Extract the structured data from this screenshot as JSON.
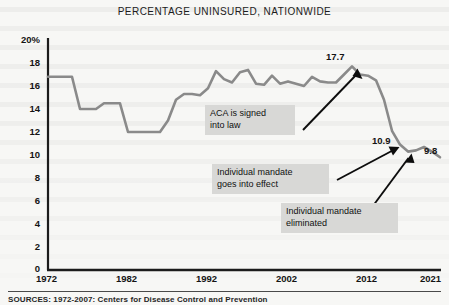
{
  "chart_data": {
    "type": "line",
    "title": "PERCENTAGE UNINSURED, NATIONWIDE",
    "xlabel": "",
    "ylabel": "",
    "xlim": [
      1972,
      2021
    ],
    "ylim": [
      0,
      20
    ],
    "grid": false,
    "legend": null,
    "line_color": "#8a8a8a",
    "xticks": [
      "1972",
      "1982",
      "1992",
      "2002",
      "2012",
      "2021"
    ],
    "xtick_values": [
      1972,
      1982,
      1992,
      2002,
      2012,
      2021
    ],
    "yticks": [
      "0",
      "2",
      "4",
      "6",
      "8",
      "10",
      "12",
      "14",
      "16",
      "18",
      "20%"
    ],
    "ytick_values": [
      0,
      2,
      4,
      6,
      8,
      10,
      12,
      14,
      16,
      18,
      20
    ],
    "series": [
      {
        "name": "Percentage uninsured, nationwide",
        "x": [
          1972,
          1973,
          1974,
          1975,
          1976,
          1977,
          1978,
          1979,
          1980,
          1981,
          1982,
          1983,
          1984,
          1985,
          1986,
          1987,
          1988,
          1989,
          1990,
          1991,
          1992,
          1993,
          1994,
          1995,
          1996,
          1997,
          1998,
          1999,
          2000,
          2001,
          2002,
          2003,
          2004,
          2005,
          2006,
          2007,
          2008,
          2009,
          2010,
          2011,
          2012,
          2013,
          2014,
          2015,
          2016,
          2017,
          2018,
          2019,
          2020,
          2021
        ],
        "y": [
          16.8,
          16.8,
          16.8,
          16.8,
          14.0,
          14.0,
          14.0,
          14.5,
          14.5,
          14.5,
          12.0,
          12.0,
          12.0,
          12.0,
          12.0,
          13.0,
          14.8,
          15.3,
          15.3,
          15.2,
          15.8,
          17.3,
          16.6,
          16.3,
          17.2,
          17.4,
          16.2,
          16.1,
          16.9,
          16.2,
          16.4,
          16.2,
          16.0,
          16.8,
          16.4,
          16.3,
          16.3,
          17.0,
          17.7,
          17.0,
          16.9,
          16.5,
          14.8,
          12.1,
          10.9,
          10.3,
          10.4,
          10.7,
          10.3,
          9.8
        ]
      }
    ],
    "point_labels": [
      {
        "label": "17.7",
        "x": 2010,
        "y": 17.7
      },
      {
        "label": "10.9",
        "x": 2016,
        "y": 10.9
      },
      {
        "label": "9.8",
        "x": 2021,
        "y": 9.8
      }
    ],
    "annotations": [
      {
        "text": "ACA is signed\ninto law",
        "target_x": 2010,
        "target_y": 17.7
      },
      {
        "text": "Individual mandate\ngoes into effect",
        "target_x": 2016,
        "target_y": 10.9
      },
      {
        "text": "Individual mandate\neliminated",
        "target_x": 2019,
        "target_y": 10.7
      }
    ]
  },
  "chart": {
    "title": "PERCENTAGE UNINSURED, NATIONWIDE"
  },
  "source": {
    "note": "SOURCES: 1972-2007: Centers for Disease Control and Prevention"
  },
  "labels": {
    "y0": "0",
    "y2": "2",
    "y4": "4",
    "y6": "6",
    "y8": "8",
    "y10": "10",
    "y12": "12",
    "y14": "14",
    "y16": "16",
    "y18": "18",
    "y20": "20%",
    "x1972": "1972",
    "x1982": "1982",
    "x1992": "1992",
    "x2002": "2002",
    "x2012": "2012",
    "x2021": "2021",
    "p1": "17.7",
    "p2": "10.9",
    "p3": "9.8",
    "a1": "ACA is signed\ninto law",
    "a2": "Individual mandate\ngoes into effect",
    "a3": "Individual mandate\neliminated"
  }
}
